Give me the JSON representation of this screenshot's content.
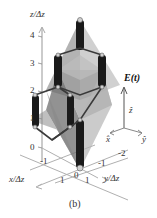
{
  "figure": {
    "caption": "(b)",
    "z_axis": {
      "label": "z/Δz",
      "ticks": [
        "0",
        "1",
        "2",
        "3",
        "4"
      ]
    },
    "x_axis": {
      "label": "x/Δz",
      "ticks": [
        "-1",
        "0",
        "1"
      ]
    },
    "y_axis": {
      "label": "y/Δz",
      "ticks": [
        "-2",
        "-1",
        "0",
        "1"
      ]
    },
    "field_vector": {
      "label": "E(t)",
      "unit_z": "ẑ",
      "unit_x": "x̂",
      "unit_y": "ŷ"
    },
    "colors": {
      "axis": "#a8a8a8",
      "rod": "#1a1a1a",
      "node": "#c8c8c8",
      "shade_dark": "#6e6e6e",
      "shade_mid": "#9a9a9a",
      "shade_light": "#c4c4c4"
    }
  }
}
